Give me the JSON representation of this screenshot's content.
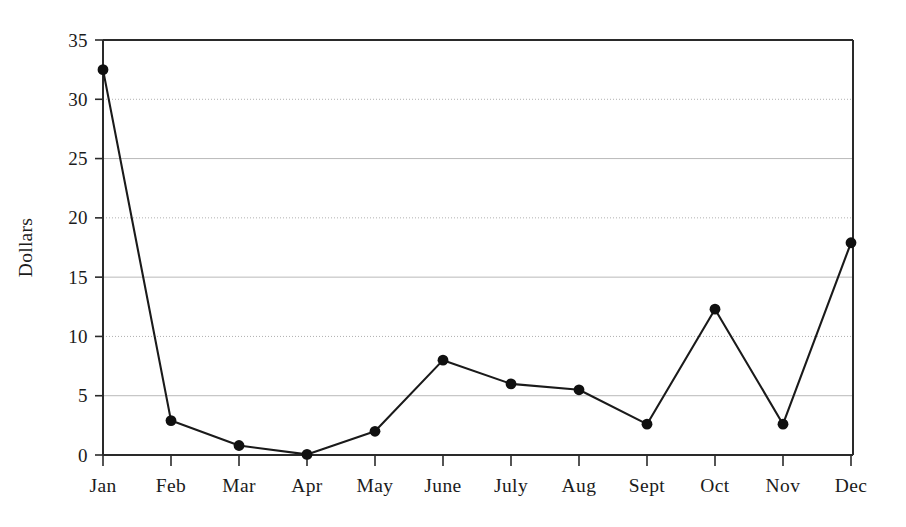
{
  "chart_data": {
    "type": "line",
    "title": "",
    "xlabel": "",
    "ylabel": "Dollars",
    "categories": [
      "Jan",
      "Feb",
      "Mar",
      "Apr",
      "May",
      "June",
      "July",
      "Aug",
      "Sept",
      "Oct",
      "Nov",
      "Dec"
    ],
    "values": [
      32.5,
      2.9,
      0.8,
      0.05,
      2.0,
      8.0,
      6.0,
      5.5,
      2.6,
      12.3,
      2.6,
      17.9
    ],
    "series": [
      {
        "name": "Dollars",
        "values": [
          32.5,
          2.9,
          0.8,
          0.05,
          2.0,
          8.0,
          6.0,
          5.5,
          2.6,
          12.3,
          2.6,
          17.9
        ]
      }
    ],
    "ylim": [
      0,
      35
    ],
    "yticks": [
      0,
      5,
      10,
      15,
      20,
      25,
      30,
      35
    ],
    "ytick_labels": [
      "0",
      "5",
      "10",
      "15",
      "20",
      "25",
      "30",
      "35"
    ],
    "grid": true,
    "grid_axis": "y",
    "legend": false,
    "legend_position": "none",
    "markers": "filled-circle",
    "line_color": "#1a1a1a",
    "marker_color": "#101010",
    "grid_color": "#b9b9b9",
    "background_color": "#ffffff"
  },
  "axes": {
    "y_title": "Dollars"
  }
}
